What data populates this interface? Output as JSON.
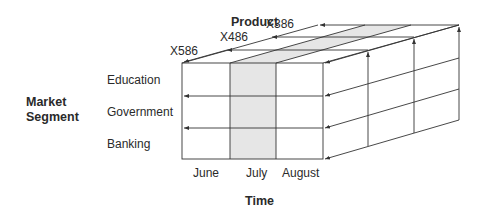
{
  "axes": {
    "product": {
      "title": "Product",
      "labels": [
        "X586",
        "X486",
        "X386"
      ]
    },
    "market_segment": {
      "title_line1": "Market",
      "title_line2": "Segment",
      "labels": [
        "Education",
        "Government",
        "Banking"
      ]
    },
    "time": {
      "title": "Time",
      "labels": [
        "June",
        "July",
        "August"
      ]
    }
  },
  "highlight": {
    "dimension": "time",
    "value": "July",
    "color": "#e6e6e6"
  },
  "colors": {
    "line": "#333333",
    "highlight": "#e6e6e6"
  }
}
